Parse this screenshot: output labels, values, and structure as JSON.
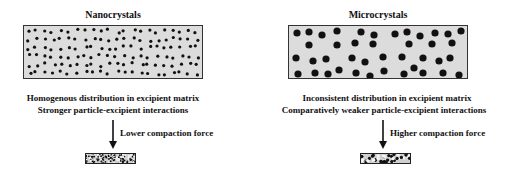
{
  "panels": [
    {
      "title": "Nanocrystals",
      "captions": [
        "Homogenous distribution in excipient matrix",
        "Stronger particle-excipient interactions"
      ],
      "force_label": "Lower compaction force",
      "particle": "small",
      "distribution": "homogeneous"
    },
    {
      "title": "Microcrystals",
      "captions": [
        "Inconsistent distribution in excipient matrix",
        "Comparatively weaker particle-excipient interactions"
      ],
      "force_label": "Higher compaction force",
      "particle": "large",
      "distribution": "inconsistent"
    }
  ],
  "colors": {
    "matrix_fill": "#dcdcdc",
    "particle": "#111111",
    "border": "#333333"
  }
}
